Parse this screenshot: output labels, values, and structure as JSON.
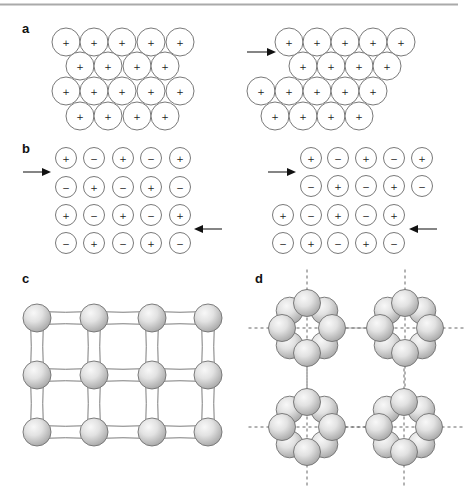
{
  "figure": {
    "top_rule": {
      "x1": 0,
      "x2": 458,
      "y": 4.5
    },
    "panels": {
      "a": {
        "label": "a",
        "label_pos": [
          22,
          33
        ],
        "ion_radius": 14,
        "left": {
          "rows": [
            {
              "y": 42,
              "xs": [
                66,
                94,
                122,
                151,
                180
              ],
              "signs": [
                "+",
                "+",
                "+",
                "+",
                "+"
              ]
            },
            {
              "y": 66,
              "xs": [
                80,
                108,
                137,
                165
              ],
              "signs": [
                "+",
                "+",
                "+",
                "+"
              ]
            },
            {
              "y": 91,
              "xs": [
                66,
                94,
                122,
                151,
                180
              ],
              "signs": [
                "+",
                "+",
                "+",
                "+",
                "+"
              ]
            },
            {
              "y": 116,
              "xs": [
                80,
                108,
                137,
                165
              ],
              "signs": [
                "+",
                "+",
                "+",
                "+"
              ]
            }
          ]
        },
        "right": {
          "rows": [
            {
              "y": 42,
              "xs": [
                289,
                317,
                345,
                373,
                401
              ],
              "signs": [
                "+",
                "+",
                "+",
                "+",
                "+"
              ]
            },
            {
              "y": 66,
              "xs": [
                303,
                331,
                359,
                387
              ],
              "signs": [
                "+",
                "+",
                "+",
                "+"
              ]
            },
            {
              "y": 91,
              "xs": [
                261,
                289,
                317,
                345,
                373
              ],
              "signs": [
                "+",
                "+",
                "+",
                "+",
                "+"
              ]
            },
            {
              "y": 116,
              "xs": [
                275,
                303,
                331,
                359
              ],
              "signs": [
                "+",
                "+",
                "+",
                "+"
              ]
            }
          ],
          "arrows": [
            {
              "x1": 247,
              "x2": 276,
              "y": 52,
              "direction": "right"
            }
          ]
        }
      },
      "b": {
        "label": "b",
        "label_pos": [
          22,
          153
        ],
        "ion_radius": 10.5,
        "left": {
          "rows": [
            {
              "y": 158,
              "xs": [
                66,
                94,
                123,
                151,
                180
              ],
              "signs": [
                "+",
                "−",
                "+",
                "−",
                "+"
              ]
            },
            {
              "y": 187,
              "xs": [
                66,
                94,
                123,
                151,
                180
              ],
              "signs": [
                "−",
                "+",
                "−",
                "+",
                "−"
              ]
            },
            {
              "y": 215,
              "xs": [
                66,
                94,
                123,
                151,
                180
              ],
              "signs": [
                "+",
                "−",
                "+",
                "−",
                "+"
              ]
            },
            {
              "y": 243,
              "xs": [
                66,
                94,
                123,
                151,
                180
              ],
              "signs": [
                "−",
                "+",
                "−",
                "+",
                "−"
              ]
            }
          ],
          "arrows": [
            {
              "x1": 23,
              "x2": 51,
              "y": 172,
              "direction": "right"
            },
            {
              "x1": 222,
              "x2": 194,
              "y": 229,
              "direction": "left"
            }
          ]
        },
        "right": {
          "rows": [
            {
              "y": 158,
              "xs": [
                311,
                338,
                366,
                394,
                422
              ],
              "signs": [
                "+",
                "−",
                "+",
                "−",
                "+"
              ]
            },
            {
              "y": 186,
              "xs": [
                311,
                338,
                366,
                394,
                422
              ],
              "signs": [
                "−",
                "+",
                "−",
                "+",
                "−"
              ]
            },
            {
              "y": 215,
              "xs": [
                283,
                311,
                338,
                366,
                394
              ],
              "signs": [
                "+",
                "−",
                "+",
                "−",
                "+"
              ]
            },
            {
              "y": 243,
              "xs": [
                283,
                311,
                338,
                366,
                394
              ],
              "signs": [
                "−",
                "+",
                "−",
                "+",
                "−"
              ]
            }
          ],
          "arrows": [
            {
              "x1": 268,
              "x2": 296,
              "y": 172,
              "direction": "right"
            },
            {
              "x1": 437,
              "x2": 409,
              "y": 229,
              "direction": "left"
            }
          ]
        }
      },
      "c": {
        "label": "c",
        "label_pos": [
          22,
          283
        ],
        "sphere_radius": 14,
        "bond_half_width": 6.5,
        "xs": [
          37,
          94,
          152,
          208
        ],
        "ys": [
          318,
          375,
          432
        ]
      },
      "d": {
        "label": "d",
        "label_pos": [
          255,
          283
        ],
        "ring_radius": 25,
        "sphere_radius": 13.5,
        "spheres_per_ring": 8,
        "ring_centers": [
          [
            307,
            328
          ],
          [
            405,
            328
          ],
          [
            307,
            427
          ],
          [
            404,
            427
          ]
        ],
        "dash_extent": 20
      }
    },
    "colors": {
      "sphere_highlight": "#f7f7f7",
      "sphere_mid": "#dcdcdc",
      "sphere_edge": "#a8a8a8",
      "outline": "#6e6e6e",
      "ink": "#111111",
      "rule": "#aaaaaa"
    }
  }
}
